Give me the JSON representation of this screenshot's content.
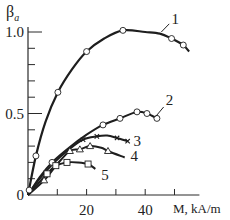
{
  "chart_data": {
    "type": "line",
    "title": "",
    "ylabel": "β",
    "ylabel_sub": "a",
    "xlabel": "M, kA/m",
    "xlim": [
      0,
      60
    ],
    "ylim": [
      0,
      1.05
    ],
    "x_ticks": [
      10,
      20,
      30,
      40,
      50
    ],
    "x_tick_labels": [
      "20",
      "40"
    ],
    "x_tick_label_values": [
      20,
      40
    ],
    "y_ticks": [
      0.1,
      0.2,
      0.3,
      0.4,
      0.5,
      0.6,
      0.7,
      0.8,
      0.9,
      1.0
    ],
    "y_tick_labels": [
      "0",
      "0.5",
      "1.0"
    ],
    "y_tick_label_values": [
      0,
      0.5,
      1.0
    ],
    "grid": false,
    "legend": "curve number labels placed at curve ends",
    "series": [
      {
        "name": "1",
        "marker": "circle",
        "curve": [
          [
            0,
            0
          ],
          [
            2.7,
            0.24
          ],
          [
            6,
            0.45
          ],
          [
            10.2,
            0.63
          ],
          [
            15,
            0.77
          ],
          [
            20,
            0.88
          ],
          [
            26,
            0.96
          ],
          [
            32.4,
            1.01
          ],
          [
            40,
            1.0
          ],
          [
            45,
            0.99
          ],
          [
            49,
            0.96
          ],
          [
            53,
            0.92
          ],
          [
            55,
            0.88
          ]
        ],
        "points": [
          [
            0.4,
            0.03
          ],
          [
            2.7,
            0.24
          ],
          [
            10.2,
            0.63
          ],
          [
            20,
            0.88
          ],
          [
            32.4,
            1.01
          ],
          [
            49,
            0.96
          ],
          [
            53,
            0.92
          ]
        ],
        "label_pos": [
          49,
          1.08
        ]
      },
      {
        "name": "2",
        "marker": "circle",
        "curve": [
          [
            0,
            0
          ],
          [
            4,
            0.11
          ],
          [
            8.2,
            0.2
          ],
          [
            14,
            0.29
          ],
          [
            20,
            0.37
          ],
          [
            25.6,
            0.43
          ],
          [
            31.4,
            0.47
          ],
          [
            37.2,
            0.51
          ],
          [
            40.6,
            0.5
          ],
          [
            44,
            0.47
          ]
        ],
        "points": [
          [
            8.2,
            0.2
          ],
          [
            25.6,
            0.43
          ],
          [
            31.4,
            0.47
          ],
          [
            37.2,
            0.51
          ],
          [
            40.6,
            0.5
          ],
          [
            44,
            0.47
          ]
        ],
        "label_pos": [
          47,
          0.58
        ]
      },
      {
        "name": "3",
        "marker": "x",
        "curve": [
          [
            0,
            0
          ],
          [
            4,
            0.1
          ],
          [
            9,
            0.2
          ],
          [
            14,
            0.28
          ],
          [
            18.8,
            0.34
          ],
          [
            23.5,
            0.36
          ],
          [
            27,
            0.365
          ],
          [
            30.4,
            0.35
          ],
          [
            34,
            0.33
          ]
        ],
        "points": [
          [
            18.8,
            0.34
          ],
          [
            23.5,
            0.36
          ],
          [
            30.4,
            0.35
          ],
          [
            34,
            0.33
          ]
        ],
        "label_pos": [
          36,
          0.33
        ]
      },
      {
        "name": "4",
        "marker": "triangle",
        "curve": [
          [
            0,
            0
          ],
          [
            5.5,
            0.09
          ],
          [
            10,
            0.19
          ],
          [
            14.3,
            0.27
          ],
          [
            17.7,
            0.28
          ],
          [
            21.2,
            0.3
          ],
          [
            25,
            0.29
          ],
          [
            27.3,
            0.27
          ],
          [
            33,
            0.23
          ]
        ],
        "points": [
          [
            5.5,
            0.09
          ],
          [
            14.3,
            0.27
          ],
          [
            17.7,
            0.28
          ],
          [
            21.2,
            0.3
          ],
          [
            27.3,
            0.27
          ]
        ],
        "label_pos": [
          35,
          0.24
        ]
      },
      {
        "name": "5",
        "marker": "square",
        "curve": [
          [
            0,
            0
          ],
          [
            3,
            0.06
          ],
          [
            6.5,
            0.13
          ],
          [
            9.5,
            0.18
          ],
          [
            13.3,
            0.2
          ],
          [
            17,
            0.2
          ],
          [
            20.5,
            0.19
          ],
          [
            23,
            0.16
          ]
        ],
        "points": [
          [
            6.5,
            0.13
          ],
          [
            9.5,
            0.18
          ],
          [
            13.3,
            0.2
          ],
          [
            20.5,
            0.19
          ]
        ],
        "label_pos": [
          25,
          0.12
        ]
      }
    ]
  }
}
